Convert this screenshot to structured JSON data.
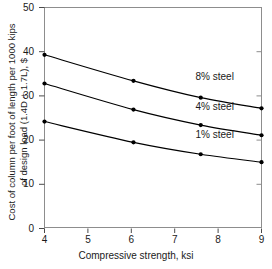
{
  "chart_data": {
    "type": "line",
    "title": "",
    "xlabel": "Compressive strength, ksi",
    "ylabel_line1": "Cost of column per foot of length per 1000 kips",
    "ylabel_line2": "of design load (1.4D + 1.7L), $",
    "xlim": [
      4,
      9
    ],
    "ylim": [
      0,
      50
    ],
    "xticks": [
      4,
      5,
      6,
      7,
      8,
      9
    ],
    "xtick_labels": [
      "4",
      "5",
      "6",
      "7",
      "8",
      "9"
    ],
    "yticks": [
      0,
      10,
      20,
      30,
      40,
      50
    ],
    "ytick_labels": [
      "0",
      "10",
      "20",
      "30",
      "40",
      "50"
    ],
    "y_right_ticks": [
      10,
      20,
      30,
      40
    ],
    "grid": false,
    "legend_position": "inline-annotations",
    "marker": "filled-circle",
    "series": [
      {
        "name": "8% steel",
        "label": "8% steel",
        "color": "#000000",
        "x": [
          4.0,
          6.05,
          7.6,
          9.0
        ],
        "values": [
          39.3,
          33.4,
          29.6,
          27.2
        ],
        "label_x": 9.0,
        "label_y": 34.2
      },
      {
        "name": "4% steel",
        "label": "4% steel",
        "color": "#000000",
        "x": [
          4.0,
          6.05,
          7.6,
          9.0
        ],
        "values": [
          32.8,
          26.9,
          23.4,
          21.1
        ],
        "label_x": 9.0,
        "label_y": 27.6
      },
      {
        "name": "1% steel",
        "label": "1% steel",
        "color": "#000000",
        "x": [
          4.0,
          6.05,
          7.6,
          9.0
        ],
        "values": [
          24.2,
          19.5,
          16.8,
          15.0
        ],
        "label_x": 9.0,
        "label_y": 21.2
      }
    ]
  },
  "caption": {
    "text": ""
  }
}
